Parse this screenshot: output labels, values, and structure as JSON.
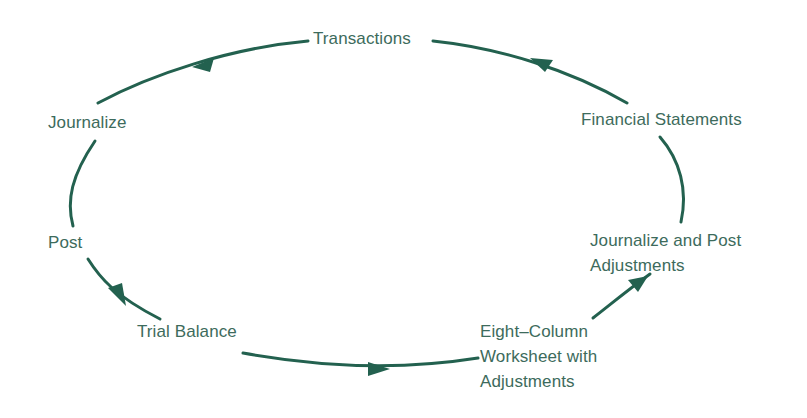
{
  "diagram": {
    "title": "",
    "colors": {
      "stroke": "#23614f",
      "text": "#3d6b5c",
      "background": "#ffffff"
    },
    "nodes": [
      {
        "id": "transactions",
        "label": "Transactions"
      },
      {
        "id": "journalize",
        "label": "Journalize"
      },
      {
        "id": "post",
        "label": "Post"
      },
      {
        "id": "trial_balance",
        "label": "Trial Balance"
      },
      {
        "id": "worksheet",
        "lines": [
          "Eight–Column",
          "Worksheet with",
          "Adjustments"
        ]
      },
      {
        "id": "adjustments",
        "lines": [
          "Journalize and Post",
          "Adjustments"
        ]
      },
      {
        "id": "financial_statements",
        "label": "Financial Statements"
      }
    ],
    "edges": [
      {
        "from": "transactions",
        "to": "journalize",
        "arrow": true
      },
      {
        "from": "journalize",
        "to": "post",
        "arrow": false
      },
      {
        "from": "post",
        "to": "trial_balance",
        "arrow": true
      },
      {
        "from": "trial_balance",
        "to": "worksheet",
        "arrow": true
      },
      {
        "from": "worksheet",
        "to": "adjustments",
        "arrow": true
      },
      {
        "from": "adjustments",
        "to": "financial_statements",
        "arrow": false
      },
      {
        "from": "financial_statements",
        "to": "transactions",
        "arrow": true
      }
    ],
    "layout": "cycle"
  }
}
